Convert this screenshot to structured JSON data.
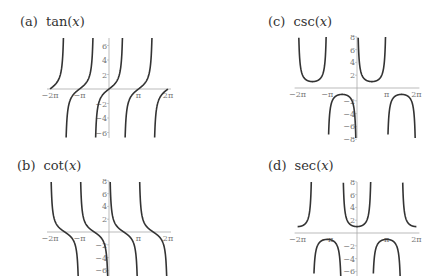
{
  "chart_data": [
    {
      "id": "a",
      "type": "line",
      "title": "(a) tan(x)",
      "label": "(a)",
      "function": "tan",
      "x_range": [
        -6.2832,
        6.2832
      ],
      "ylim": [
        -7,
        7
      ],
      "x_ticks": [
        "−2π",
        "−π",
        "π",
        "2π"
      ],
      "x_tick_values": [
        -6.2832,
        -3.1416,
        3.1416,
        6.2832
      ],
      "y_ticks": [
        "6",
        "4",
        "2",
        "−2",
        "−4",
        "−6"
      ],
      "y_tick_values": [
        6,
        4,
        2,
        -2,
        -4,
        -6
      ],
      "asymptotes": [
        -4.7124,
        -1.5708,
        1.5708,
        4.7124
      ],
      "grid": false,
      "legend": null
    },
    {
      "id": "c",
      "type": "line",
      "title": "(c) csc(x)",
      "label": "(c)",
      "function": "csc",
      "x_range": [
        -6.2832,
        6.2832
      ],
      "ylim": [
        -8,
        8
      ],
      "x_ticks": [
        "−2π",
        "−π",
        "π",
        "2π"
      ],
      "x_tick_values": [
        -6.2832,
        -3.1416,
        3.1416,
        6.2832
      ],
      "y_ticks": [
        "8",
        "6",
        "4",
        "2",
        "−2",
        "−4",
        "−6",
        "−8"
      ],
      "y_tick_values": [
        8,
        6,
        4,
        2,
        -2,
        -4,
        -6,
        -8
      ],
      "asymptotes": [
        -6.2832,
        -3.1416,
        0,
        3.1416,
        6.2832
      ],
      "grid": false,
      "legend": null
    },
    {
      "id": "b",
      "type": "line",
      "title": "(b) cot(x)",
      "label": "(b)",
      "function": "cot",
      "x_range": [
        -6.2832,
        6.2832
      ],
      "ylim": [
        -8,
        8
      ],
      "x_ticks": [
        "−2π",
        "−π",
        "π",
        "2π"
      ],
      "x_tick_values": [
        -6.2832,
        -3.1416,
        3.1416,
        6.2832
      ],
      "y_ticks": [
        "8",
        "6",
        "4",
        "2",
        "−2",
        "−4",
        "−6"
      ],
      "y_tick_values": [
        8,
        6,
        4,
        2,
        -2,
        -4,
        -6
      ],
      "asymptotes": [
        -6.2832,
        -3.1416,
        0,
        3.1416,
        6.2832
      ],
      "grid": false,
      "legend": null
    },
    {
      "id": "d",
      "type": "line",
      "title": "(d) sec(x)",
      "label": "(d)",
      "function": "sec",
      "x_range": [
        -6.2832,
        6.2832
      ],
      "ylim": [
        -8,
        8
      ],
      "x_ticks": [
        "−2π",
        "−π",
        "π",
        "2π"
      ],
      "x_tick_values": [
        -6.2832,
        -3.1416,
        3.1416,
        6.2832
      ],
      "y_ticks": [
        "8",
        "6",
        "4",
        "2",
        "−2",
        "−4",
        "−6"
      ],
      "y_tick_values": [
        8,
        6,
        4,
        2,
        -2,
        -4,
        -6
      ],
      "asymptotes": [
        -4.7124,
        -1.5708,
        1.5708,
        4.7124
      ],
      "grid": false,
      "legend": null
    }
  ],
  "captions": {
    "a": {
      "label": "(a)",
      "fn": "tan",
      "arg": "x"
    },
    "b": {
      "label": "(b)",
      "fn": "cot",
      "arg": "x"
    },
    "c": {
      "label": "(c)",
      "fn": "csc",
      "arg": "x"
    },
    "d": {
      "label": "(d)",
      "fn": "sec",
      "arg": "x"
    }
  },
  "style": {
    "curve_color": "#333333",
    "axis_color": "#aaaaaa",
    "tick_color": "#777777"
  }
}
